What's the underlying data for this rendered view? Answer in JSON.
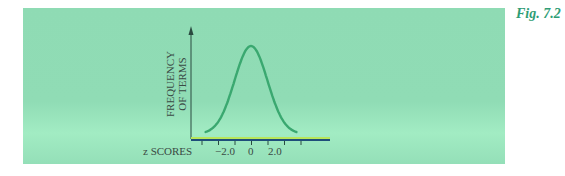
{
  "figure": {
    "label": "Fig. 7.2",
    "background_color": "#8fdbb4",
    "curve_color": "#3aa870"
  },
  "chart_data": {
    "type": "line",
    "title": "",
    "xlabel": "z SCORES",
    "ylabel_line1": "FREQUENCY",
    "ylabel_line2": "OF TERMS",
    "ylabel": "FREQUENCY OF TERMS",
    "x_tick_labels": [
      "−2.0",
      "0",
      "2.0"
    ],
    "x_ticks": [
      -3,
      -2,
      -1,
      0,
      1,
      2,
      3
    ],
    "xlim": [
      -3.5,
      4
    ],
    "grid": false,
    "legend": "none",
    "series": [
      {
        "name": "normal distribution",
        "x": [
          -3,
          -2.5,
          -2,
          -1.5,
          -1,
          -0.5,
          0,
          0.5,
          1,
          1.5,
          2,
          2.5,
          3
        ],
        "values": [
          0.004,
          0.018,
          0.054,
          0.13,
          0.242,
          0.352,
          0.399,
          0.352,
          0.242,
          0.13,
          0.054,
          0.018,
          0.004
        ]
      }
    ]
  }
}
